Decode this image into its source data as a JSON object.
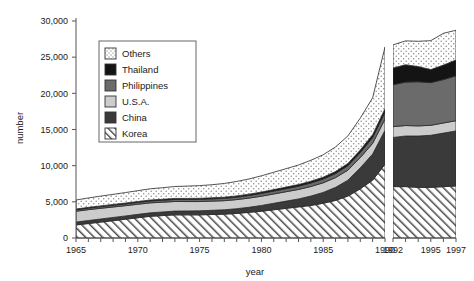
{
  "chart_data": {
    "type": "area",
    "title": "",
    "xlabel": "year",
    "ylabel": "number",
    "stacked": true,
    "grid": false,
    "legend_position": "inside-upper-left",
    "ylim": [
      0,
      30000
    ],
    "ytick_labels": [
      "0",
      "5,000",
      "10,000",
      "15,000",
      "20,000",
      "25,000",
      "30,000"
    ],
    "ytick_values": [
      0,
      5000,
      10000,
      15000,
      20000,
      25000,
      30000
    ],
    "xlim": [
      1965,
      1997
    ],
    "xtick_labels": [
      "1965",
      "1970",
      "1975",
      "1980",
      "1985",
      "1990",
      "1992",
      "1995",
      "1997"
    ],
    "xtick_values": [
      1965,
      1970,
      1975,
      1980,
      1985,
      1990,
      1992,
      1995,
      1997
    ],
    "axis_break": {
      "after": 1990,
      "before": 1992
    },
    "x": [
      1965,
      1966,
      1967,
      1968,
      1969,
      1970,
      1971,
      1972,
      1973,
      1974,
      1975,
      1976,
      1977,
      1978,
      1979,
      1980,
      1981,
      1982,
      1983,
      1984,
      1985,
      1986,
      1987,
      1988,
      1989,
      1990,
      1992,
      1993,
      1994,
      1995,
      1996,
      1997
    ],
    "series": [
      {
        "name": "Korea",
        "color": "#ffffff",
        "pattern": "diagonal-hatch",
        "values": [
          1800,
          2000,
          2200,
          2400,
          2600,
          2800,
          3000,
          3100,
          3200,
          3200,
          3200,
          3250,
          3300,
          3400,
          3550,
          3700,
          3900,
          4100,
          4300,
          4500,
          4800,
          5200,
          5800,
          6800,
          8000,
          10200,
          7100,
          7100,
          7000,
          7000,
          7100,
          7200
        ]
      },
      {
        "name": "China",
        "color": "#3a3a3a",
        "pattern": "solid",
        "values": [
          400,
          420,
          430,
          440,
          450,
          470,
          480,
          500,
          520,
          540,
          560,
          580,
          600,
          650,
          700,
          800,
          900,
          1000,
          1100,
          1300,
          1500,
          1800,
          2200,
          2900,
          3600,
          4700,
          6800,
          7000,
          7100,
          7200,
          7400,
          7600
        ]
      },
      {
        "name": "U.S.A.",
        "color": "#cccccc",
        "pattern": "solid",
        "values": [
          1500,
          1500,
          1480,
          1450,
          1420,
          1400,
          1380,
          1350,
          1330,
          1300,
          1280,
          1270,
          1260,
          1260,
          1270,
          1280,
          1290,
          1300,
          1310,
          1320,
          1330,
          1350,
          1380,
          1420,
          1480,
          1550,
          1500,
          1450,
          1400,
          1380,
          1400,
          1420
        ]
      },
      {
        "name": "Philippines",
        "color": "#6b6b6b",
        "pattern": "solid",
        "values": [
          200,
          210,
          220,
          230,
          240,
          250,
          260,
          270,
          280,
          290,
          300,
          310,
          320,
          340,
          360,
          380,
          400,
          420,
          450,
          480,
          520,
          560,
          620,
          700,
          800,
          950,
          5800,
          6000,
          6100,
          5900,
          6000,
          6200
        ]
      },
      {
        "name": "Thailand",
        "color": "#141414",
        "pattern": "solid",
        "values": [
          100,
          105,
          110,
          115,
          120,
          125,
          130,
          135,
          140,
          145,
          150,
          155,
          160,
          170,
          180,
          190,
          200,
          215,
          230,
          245,
          260,
          280,
          310,
          350,
          400,
          470,
          2300,
          2400,
          2100,
          1800,
          2000,
          2200
        ]
      },
      {
        "name": "Others",
        "color": "#ffffff",
        "pattern": "dots",
        "values": [
          1250,
          1300,
          1350,
          1400,
          1450,
          1500,
          1550,
          1600,
          1650,
          1700,
          1750,
          1800,
          1900,
          2000,
          2100,
          2250,
          2400,
          2550,
          2700,
          2900,
          3100,
          3400,
          3800,
          4400,
          5100,
          8530,
          3200,
          3300,
          3500,
          4000,
          4400,
          4100
        ]
      }
    ]
  },
  "legend": {
    "items": [
      {
        "label": "Others",
        "swatch": "dots"
      },
      {
        "label": "Thailand",
        "swatch": "solid-black"
      },
      {
        "label": "Philippines",
        "swatch": "solid-midgray"
      },
      {
        "label": "U.S.A.",
        "swatch": "solid-lightgray"
      },
      {
        "label": "China",
        "swatch": "solid-darkgray"
      },
      {
        "label": "Korea",
        "swatch": "diagonal-hatch"
      }
    ]
  },
  "colors": {
    "others": "#ffffff",
    "thailand": "#141414",
    "philippines": "#6b6b6b",
    "usa": "#cccccc",
    "china": "#3a3a3a",
    "korea": "#ffffff",
    "axis": "#555555",
    "text": "#1a1a1a"
  }
}
